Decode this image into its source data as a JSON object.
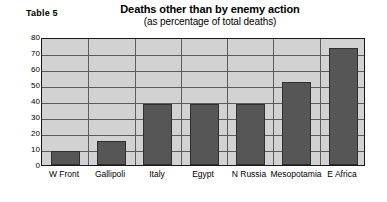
{
  "header": {
    "table_label": "Table 5"
  },
  "chart_data": {
    "type": "bar",
    "title": "Deaths other than by enemy action",
    "subtitle": "(as percentage of total deaths)",
    "xlabel": "",
    "ylabel": "",
    "categories": [
      "W Front",
      "Gallipoli",
      "Italy",
      "Egypt",
      "N Russia",
      "Mesopotamia",
      "E Africa"
    ],
    "values": [
      9,
      15,
      38,
      38,
      38,
      52,
      73
    ],
    "ylim": [
      0,
      80
    ],
    "yticks": [
      0,
      10,
      20,
      30,
      40,
      50,
      60,
      70,
      80
    ],
    "ytick_labels": [
      "0",
      "10",
      "20",
      "30",
      "40",
      "50",
      "60",
      "70",
      "80"
    ],
    "grid": true,
    "legend": false,
    "colors": {
      "bar": "#565656",
      "bar_border": "#2f2f2f",
      "plot_background": "#d2d2d2",
      "grid": "#5c5c5c",
      "frame": "#1a1a1a",
      "page_background": "#ffffff",
      "text": "#000000"
    }
  }
}
